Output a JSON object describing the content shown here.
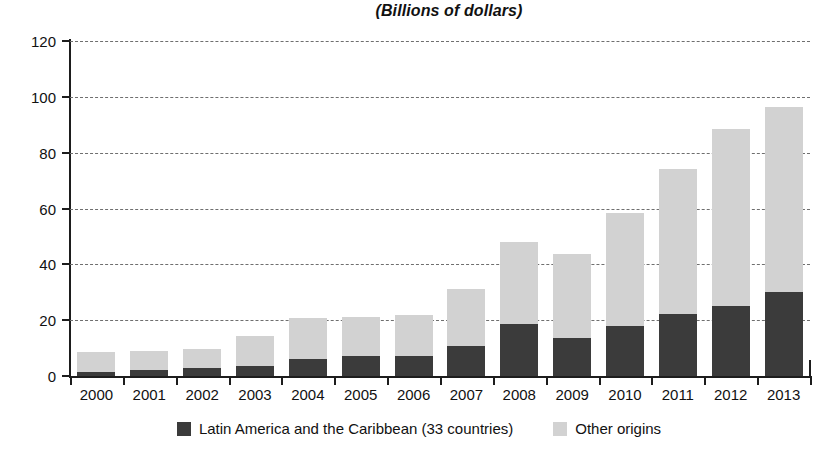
{
  "chart_data": {
    "type": "bar",
    "subtype": "stacked-vertical",
    "title": "(Billions of dollars)",
    "xlabel": "",
    "ylabel": "",
    "ylim": [
      0,
      120
    ],
    "yticks": [
      0,
      20,
      40,
      60,
      80,
      100,
      120
    ],
    "grid": true,
    "grid_style": "horizontal-dashed",
    "legend_position": "bottom-center",
    "categories": [
      "2000",
      "2001",
      "2002",
      "2003",
      "2004",
      "2005",
      "2006",
      "2007",
      "2008",
      "2009",
      "2010",
      "2011",
      "2012",
      "2013"
    ],
    "series": [
      {
        "name": "Latin America and the Caribbean (33 countries)",
        "color": "#3b3b3b",
        "values": [
          1.5,
          2.0,
          2.7,
          3.5,
          6.0,
          7.0,
          7.0,
          10.8,
          18.5,
          13.5,
          17.8,
          22.3,
          25.0,
          30.0
        ]
      },
      {
        "name": "Other origins",
        "color": "#d2d2d2",
        "values": [
          7.1,
          7.0,
          7.1,
          11.0,
          14.8,
          14.3,
          15.0,
          20.5,
          29.5,
          30.3,
          40.7,
          51.7,
          63.5,
          66.5
        ]
      }
    ],
    "totals": [
      8.6,
      9.0,
      9.8,
      14.5,
      20.8,
      21.3,
      22.0,
      31.3,
      48.0,
      43.8,
      58.5,
      74.0,
      88.5,
      96.5
    ]
  },
  "legend": {
    "items": [
      {
        "label": "Latin America and the Caribbean (33 countries)",
        "swatch": "lac"
      },
      {
        "label": "Other origins",
        "swatch": "other"
      }
    ]
  }
}
